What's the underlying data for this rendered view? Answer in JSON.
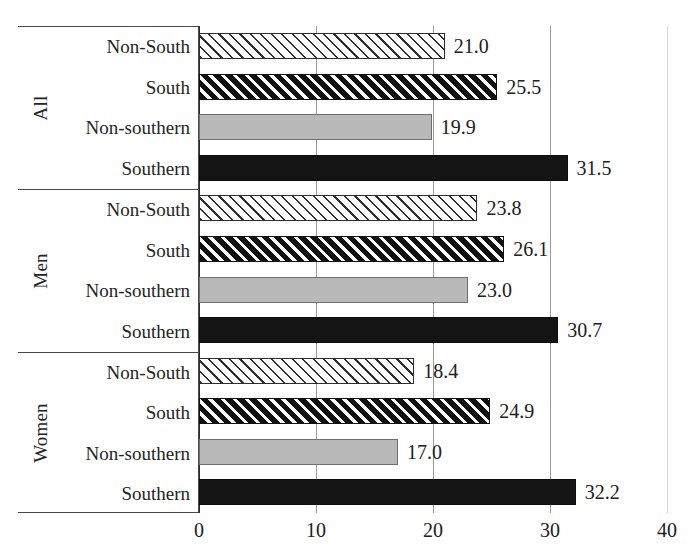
{
  "chart_data": {
    "type": "bar",
    "orientation": "horizontal",
    "title": "",
    "xlabel": "",
    "ylabel": "",
    "xlim": [
      0,
      40
    ],
    "x_ticks": [
      "0",
      "10",
      "20",
      "30",
      "40"
    ],
    "x_tick_values": [
      0,
      10,
      20,
      30,
      40
    ],
    "grid": true,
    "grid_axis": "x",
    "legend": "none",
    "categories": [
      "Non-South",
      "South",
      "Non-southern",
      "Southern"
    ],
    "groups": [
      {
        "name": "All",
        "bars": [
          {
            "label": "Non-South",
            "value": 21.0,
            "value_text": "21.0",
            "style": "hatch-light"
          },
          {
            "label": "South",
            "value": 25.5,
            "value_text": "25.5",
            "style": "hatch-dark"
          },
          {
            "label": "Non-southern",
            "value": 19.9,
            "value_text": "19.9",
            "style": "solid-gray"
          },
          {
            "label": "Southern",
            "value": 31.5,
            "value_text": "31.5",
            "style": "solid-black"
          }
        ]
      },
      {
        "name": "Men",
        "bars": [
          {
            "label": "Non-South",
            "value": 23.8,
            "value_text": "23.8",
            "style": "hatch-light"
          },
          {
            "label": "South",
            "value": 26.1,
            "value_text": "26.1",
            "style": "hatch-dark"
          },
          {
            "label": "Non-southern",
            "value": 23.0,
            "value_text": "23.0",
            "style": "solid-gray"
          },
          {
            "label": "Southern",
            "value": 30.7,
            "value_text": "30.7",
            "style": "solid-black"
          }
        ]
      },
      {
        "name": "Women",
        "bars": [
          {
            "label": "Non-South",
            "value": 18.4,
            "value_text": "18.4",
            "style": "hatch-light"
          },
          {
            "label": "South",
            "value": 24.9,
            "value_text": "24.9",
            "style": "hatch-dark"
          },
          {
            "label": "Non-southern",
            "value": 17.0,
            "value_text": "17.0",
            "style": "solid-gray"
          },
          {
            "label": "Southern",
            "value": 32.2,
            "value_text": "32.2",
            "style": "solid-black"
          }
        ]
      }
    ],
    "colors": {
      "solid_black": "#141414",
      "solid_gray": "#b9b9b9",
      "hatch_stroke": "#2e2e2e",
      "background": "#ffffff",
      "gridline": "#9a9a9a",
      "axis": "#4a4a4a"
    }
  }
}
